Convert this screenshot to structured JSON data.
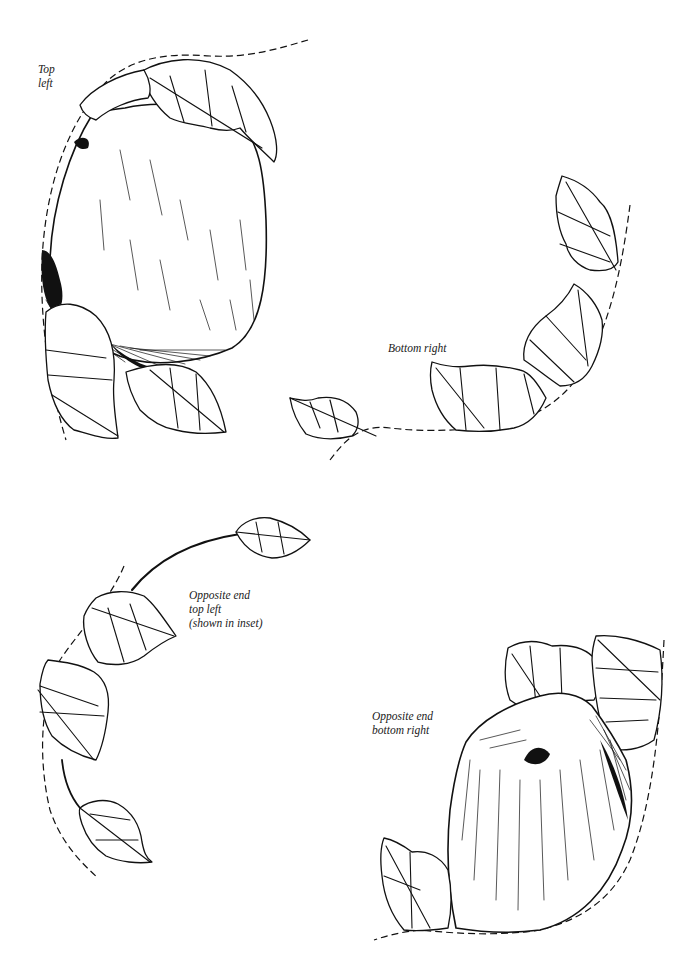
{
  "page": {
    "background": "#ffffff",
    "ink_color": "#111111"
  },
  "panels": [
    {
      "id": "top-left",
      "label": "Top\nleft",
      "content": "apple with leaves along dashed curve"
    },
    {
      "id": "bottom-right",
      "label": "Bottom right",
      "content": "leaves along dashed curve"
    },
    {
      "id": "opposite-end-top-left",
      "label": "Opposite end\ntop left\n(shown in inset)",
      "content": "stem with leaves along dashed curve"
    },
    {
      "id": "opposite-end-bottom-right",
      "label": "Opposite end\nbottom right",
      "content": "apple with leaves along dashed curve"
    }
  ]
}
